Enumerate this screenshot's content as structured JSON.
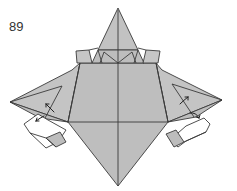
{
  "diagram": {
    "step_number": "89",
    "paper_color": "#bdbdbd",
    "paper_shade": "#c8c8c8",
    "line_color": "#3a3a3a",
    "background": "#ffffff",
    "arrows": [
      {
        "name": "left-fold-arrow-up",
        "direction": "up-left"
      },
      {
        "name": "left-fold-arrow-down",
        "direction": "down-left"
      },
      {
        "name": "right-fold-arrow-up",
        "direction": "up-right"
      },
      {
        "name": "right-fold-arrow-down",
        "direction": "down-right"
      }
    ]
  }
}
